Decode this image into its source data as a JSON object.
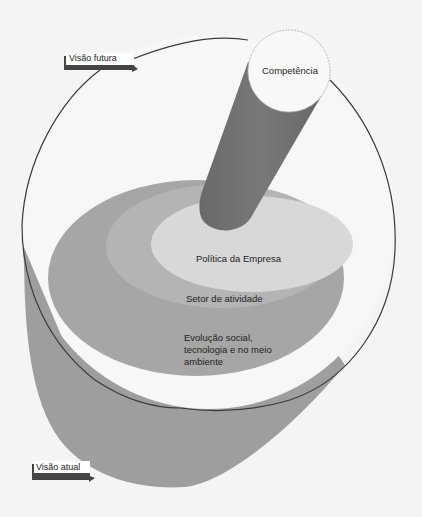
{
  "diagram": {
    "title": "",
    "top_arrow": {
      "label": "Visão futura"
    },
    "bottom_arrow": {
      "label": "Visão atual"
    },
    "cylinder": {
      "label": "Competência"
    },
    "layers": [
      {
        "label": "Política da Empresa"
      },
      {
        "label": "Setor de atividade"
      },
      {
        "label_lines": [
          "Evolução social,",
          "tecnologia e no meio",
          "ambiente"
        ]
      }
    ],
    "colors": {
      "background": "#f4f4f4",
      "base_gray": "#9e9e9e",
      "outer_layer": "#a8a8a8",
      "middle_layer": "#b6b6b6",
      "inner_layer": "#d6d6d6",
      "cylinder": "#6e6e6e",
      "cylinder_top": "#f7f7f7",
      "outline": "#3a3a3a"
    }
  }
}
